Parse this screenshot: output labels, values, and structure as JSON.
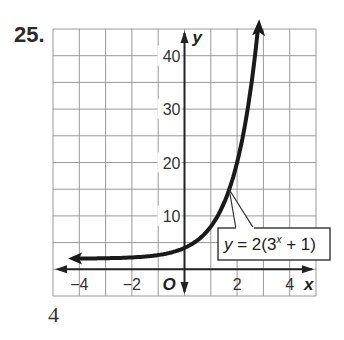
{
  "problem": {
    "number": "25.",
    "footer": "4"
  },
  "chart_data": {
    "type": "line",
    "title": "",
    "function": "y = 2(3^x + 1)",
    "label": {
      "y": "y",
      "equals": "=",
      "rhs_prefix": "2(3",
      "superscript": "x",
      "rhs_suffix": " + 1)"
    },
    "xlabel": "x",
    "ylabel": "y",
    "origin_label": "O",
    "xlim": [
      -5,
      5
    ],
    "ylim": [
      -5,
      45
    ],
    "x_ticks": [
      -4,
      -2,
      2,
      4
    ],
    "x_tick_labels": [
      "−4",
      "−2",
      "2",
      "4"
    ],
    "y_ticks": [
      10,
      20,
      30,
      40
    ],
    "y_tick_labels": [
      "10",
      "20",
      "30",
      "40"
    ],
    "grid": {
      "x_step": 1,
      "y_step": 5,
      "on": true
    },
    "points": [
      {
        "x": -4,
        "y": 2.02
      },
      {
        "x": -3,
        "y": 2.07
      },
      {
        "x": -2,
        "y": 2.22
      },
      {
        "x": -1,
        "y": 2.67
      },
      {
        "x": 0,
        "y": 4
      },
      {
        "x": 1,
        "y": 8
      },
      {
        "x": 2,
        "y": 20
      },
      {
        "x": 2.8,
        "y": 44.8
      }
    ],
    "asymptote": 2,
    "colors": {
      "curve": "#1a1a1a",
      "grid": "#9a9a9a",
      "axes": "#222222"
    }
  }
}
